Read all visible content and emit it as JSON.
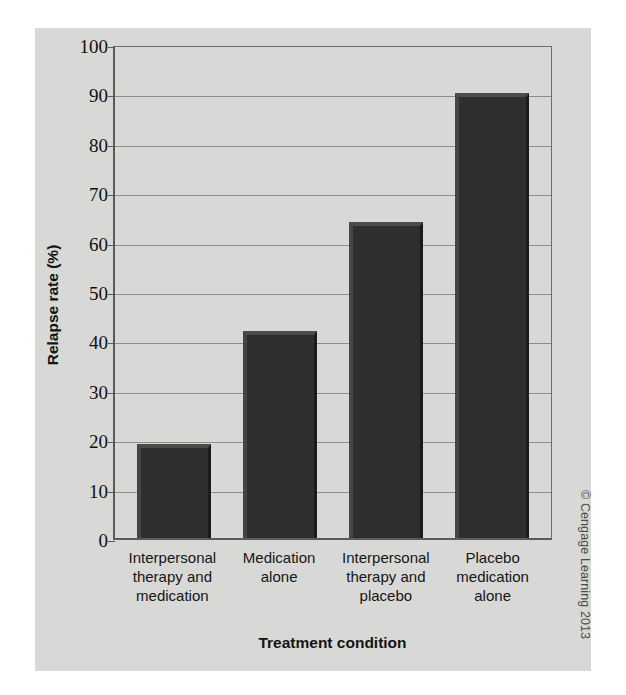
{
  "copyright": "© Cengage Learning 2013",
  "chart_data": {
    "type": "bar",
    "title": "",
    "xlabel": "Treatment condition",
    "ylabel": "Relapse rate (%)",
    "ylim": [
      0,
      100
    ],
    "ytick_step": 10,
    "yticks": [
      100,
      90,
      80,
      70,
      60,
      50,
      40,
      30,
      20,
      10,
      0
    ],
    "grid": true,
    "legend": "none",
    "bar_color": "#2e2e2e",
    "plot_background": "#d8d9d6",
    "categories": [
      "Interpersonal therapy and medication",
      "Medication alone",
      "Interpersonal therapy and placebo",
      "Placebo medication alone"
    ],
    "category_lines": [
      [
        "Interpersonal",
        "therapy and",
        "medication"
      ],
      [
        "Medication",
        "alone"
      ],
      [
        "Interpersonal",
        "therapy and",
        "placebo"
      ],
      [
        "Placebo",
        "medication",
        "alone"
      ]
    ],
    "values": [
      19,
      42,
      64,
      90
    ]
  }
}
